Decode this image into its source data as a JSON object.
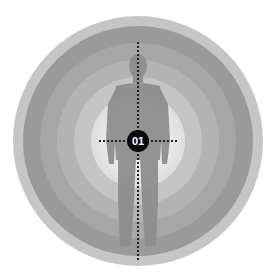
{
  "illustration": {
    "subject": "human-silhouette-target",
    "marker_label": "01",
    "ring_count": 5,
    "colors": {
      "ring_outer": "#8f8f8f",
      "ring_2": "#9c9c9c",
      "ring_3": "#aaaaaa",
      "ring_4": "#b8b8b8",
      "ring_inner": "#dcdcdc",
      "silhouette": "#8a8a8a",
      "marker_bg": "#0a0a0a",
      "crosshair": "#222222"
    }
  }
}
